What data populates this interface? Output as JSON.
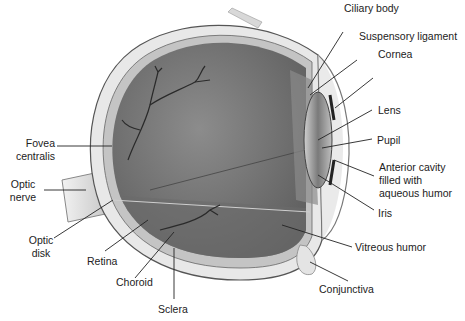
{
  "figure": {
    "labels": {
      "ciliary_body": "Ciliary body",
      "suspensory_ligament": "Suspensory ligament",
      "cornea": "Cornea",
      "lens": "Lens",
      "pupil": "Pupil",
      "anterior_cavity_1": "Anterior cavity",
      "anterior_cavity_2": "filled with",
      "anterior_cavity_3": "aqueous humor",
      "iris": "Iris",
      "vitreous_humor": "Vitreous humor",
      "conjunctiva": "Conjunctiva",
      "fovea_1": "Fovea",
      "fovea_2": "centralis",
      "optic_nerve_1": "Optic",
      "optic_nerve_2": "nerve",
      "optic_disk_1": "Optic",
      "optic_disk_2": "disk",
      "retina": "Retina",
      "choroid": "Choroid",
      "sclera": "Sclera"
    },
    "colors": {
      "background": "#ffffff",
      "vitreous": "#7a7a7a",
      "sclera": "#e6e6e6",
      "leader_line": "#222222"
    }
  }
}
